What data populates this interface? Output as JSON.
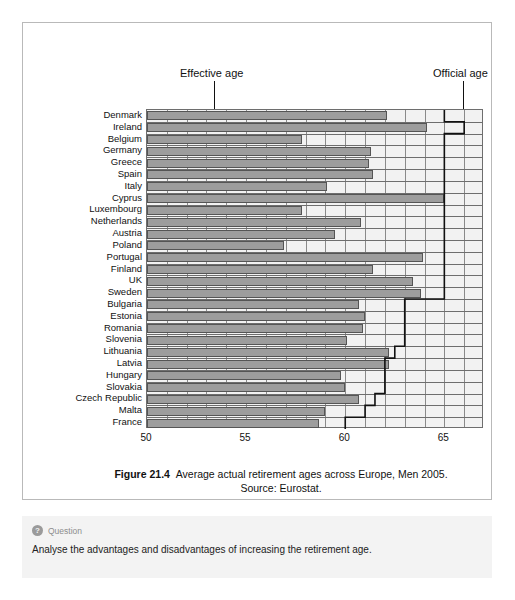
{
  "figure": {
    "caption_label": "Figure 21.4",
    "caption_text": "Average actual retirement ages across Europe, Men 2005.",
    "source": "Source: Eurostat."
  },
  "callouts": {
    "effective": "Effective age",
    "official": "Official age"
  },
  "question": {
    "icon": "question-mark-icon",
    "icon_glyph": "?",
    "label": "Question",
    "text": "Analyse the advantages and disadvantages of increasing the retirement age."
  },
  "colors": {
    "bar_fill": "#9d9d9d",
    "bar_stroke": "#555555",
    "plot_bg": "#f2f2f2",
    "gridline": "#8a8a8a",
    "step_line": "#111111",
    "panel_border": "#b9b9b9",
    "question_bg": "#f3f3f3"
  },
  "chart_data": {
    "type": "bar",
    "orientation": "horizontal",
    "title": "Average actual retirement ages across Europe, Men 2005.",
    "subtitle": "Source: Eurostat.",
    "xlabel": "",
    "ylabel": "",
    "xlim": [
      50,
      67
    ],
    "xticks": [
      50,
      55,
      60,
      65
    ],
    "xtick_labels": [
      "50",
      "55",
      "60",
      "65"
    ],
    "grid": true,
    "grid_interval": 1,
    "legend_position": "above-plot-callouts",
    "categories": [
      "Denmark",
      "Ireland",
      "Belgium",
      "Germany",
      "Greece",
      "Spain",
      "Italy",
      "Cyprus",
      "Luxembourg",
      "Netherlands",
      "Austria",
      "Poland",
      "Portugal",
      "Finland",
      "UK",
      "Sweden",
      "Bulgaria",
      "Estonia",
      "Romania",
      "Slovenia",
      "Lithuania",
      "Latvia",
      "Hungary",
      "Slovakia",
      "Czech Republic",
      "Malta",
      "France"
    ],
    "series": [
      {
        "name": "Effective age",
        "type": "bar",
        "values": [
          62.1,
          64.1,
          57.8,
          61.3,
          61.2,
          61.4,
          59.1,
          65.0,
          57.8,
          60.8,
          59.5,
          56.9,
          63.9,
          61.4,
          63.4,
          63.8,
          60.7,
          61.0,
          60.9,
          60.1,
          62.2,
          62.2,
          59.8,
          60.0,
          60.7,
          59.0,
          58.7
        ]
      },
      {
        "name": "Official age",
        "type": "step-line",
        "values": [
          65.0,
          66.0,
          65.0,
          65.0,
          65.0,
          65.0,
          65.0,
          65.0,
          65.0,
          65.0,
          65.0,
          65.0,
          65.0,
          65.0,
          65.0,
          65.0,
          63.0,
          63.0,
          63.0,
          63.0,
          62.5,
          62.0,
          62.0,
          62.0,
          61.5,
          61.0,
          60.0
        ]
      }
    ]
  },
  "axis_geometry": {
    "plot_left_px": 123,
    "plot_right_px": 460,
    "plot_top_px": 86,
    "plot_bottom_px": 405,
    "x_min_age": 50,
    "x_max_age": 67
  }
}
